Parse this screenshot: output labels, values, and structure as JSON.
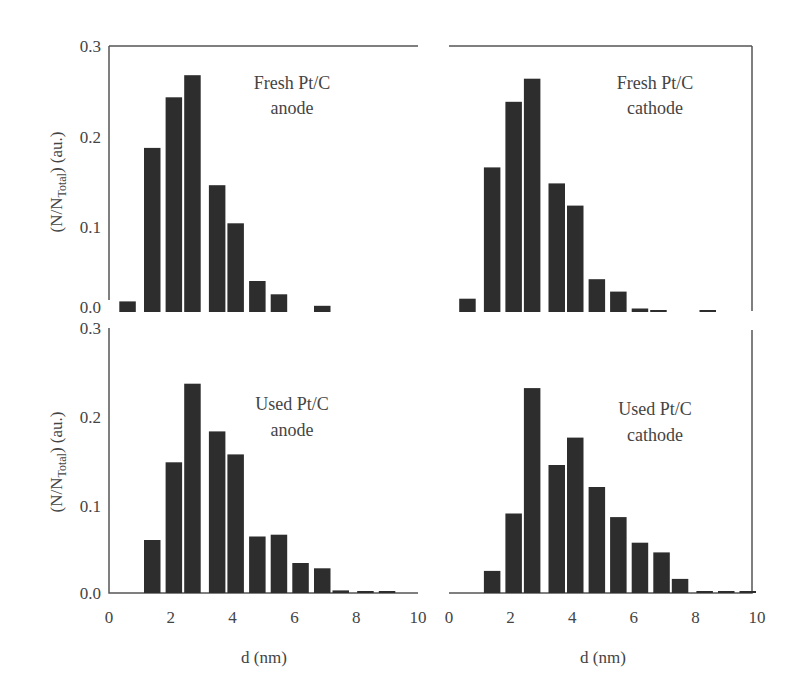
{
  "figure": {
    "ylabel_main": "(N/N",
    "ylabel_sub": "Total",
    "ylabel_tail": ") (au.)",
    "xlabel": "d (nm)",
    "yticks": [
      "0.0",
      "0.1",
      "0.2",
      "0.3"
    ],
    "xticks": [
      "0",
      "2",
      "4",
      "6",
      "8",
      "10"
    ]
  },
  "chart_data": [
    {
      "type": "bar",
      "panel": "top-left",
      "title_line1": "Fresh Pt/C",
      "title_line2": "anode",
      "xlabel": "",
      "ylabel": "(N/N_Total) (au.)",
      "xlim": [
        0,
        10
      ],
      "ylim": [
        0,
        0.3
      ],
      "x": [
        0.6,
        1.4,
        2.1,
        2.7,
        3.5,
        4.1,
        4.8,
        5.5,
        6.9
      ],
      "values": [
        0.012,
        0.185,
        0.242,
        0.267,
        0.143,
        0.1,
        0.035,
        0.02,
        0.007
      ]
    },
    {
      "type": "bar",
      "panel": "top-right",
      "title_line1": "Fresh Pt/C",
      "title_line2": "cathode",
      "xlabel": "",
      "ylabel": "",
      "xlim": [
        0,
        10
      ],
      "ylim": [
        0,
        0.3
      ],
      "x": [
        0.6,
        1.4,
        2.1,
        2.7,
        3.5,
        4.1,
        4.8,
        5.5,
        6.2,
        6.8,
        8.4
      ],
      "values": [
        0.015,
        0.163,
        0.237,
        0.263,
        0.145,
        0.12,
        0.037,
        0.023,
        0.004,
        0.002,
        0.002
      ]
    },
    {
      "type": "bar",
      "panel": "bottom-left",
      "title_line1": "Used Pt/C",
      "title_line2": "anode",
      "xlabel": "d (nm)",
      "ylabel": "(N/N_Total) (au.)",
      "xlim": [
        0,
        10
      ],
      "ylim": [
        0,
        0.3
      ],
      "x": [
        1.4,
        2.1,
        2.7,
        3.5,
        4.1,
        4.8,
        5.5,
        6.2,
        6.9,
        7.5,
        8.3,
        9.0
      ],
      "values": [
        0.06,
        0.148,
        0.237,
        0.183,
        0.157,
        0.064,
        0.066,
        0.034,
        0.028,
        0.003,
        0.002,
        0.002
      ]
    },
    {
      "type": "bar",
      "panel": "bottom-right",
      "title_line1": "Used Pt/C",
      "title_line2": "cathode",
      "xlabel": "d (nm)",
      "ylabel": "",
      "xlim": [
        0,
        10
      ],
      "ylim": [
        0,
        0.3
      ],
      "x": [
        1.4,
        2.1,
        2.7,
        3.5,
        4.1,
        4.8,
        5.5,
        6.2,
        6.9,
        7.5,
        8.3,
        9.0,
        9.7
      ],
      "values": [
        0.025,
        0.09,
        0.232,
        0.145,
        0.176,
        0.12,
        0.086,
        0.057,
        0.046,
        0.016,
        0.002,
        0.002,
        0.002
      ]
    }
  ]
}
